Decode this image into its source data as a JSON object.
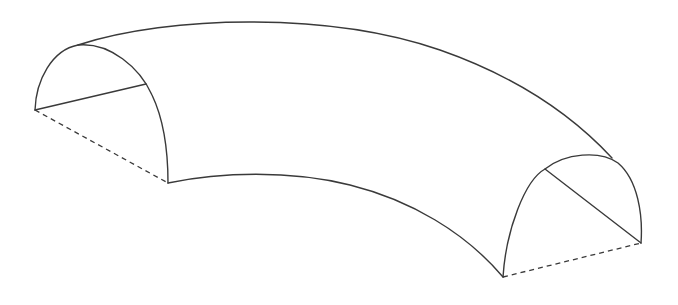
{
  "figure": {
    "colors": {
      "background": "#ffffff",
      "line": "#3a3a3a"
    },
    "parts": [
      {
        "name": "left-end-cap",
        "type": "semi-elliptical arc",
        "style": "solid"
      },
      {
        "name": "left-cap-chord",
        "type": "line",
        "style": "solid"
      },
      {
        "name": "left-base-edge",
        "type": "line",
        "style": "dashed"
      },
      {
        "name": "outer-top-edge",
        "type": "curve",
        "style": "solid"
      },
      {
        "name": "inner-bottom-edge",
        "type": "curve",
        "style": "solid"
      },
      {
        "name": "right-end-cap",
        "type": "semi-elliptical arc",
        "style": "solid"
      },
      {
        "name": "right-cap-chord",
        "type": "line",
        "style": "solid"
      },
      {
        "name": "right-base-edge",
        "type": "line",
        "style": "dashed"
      }
    ]
  }
}
